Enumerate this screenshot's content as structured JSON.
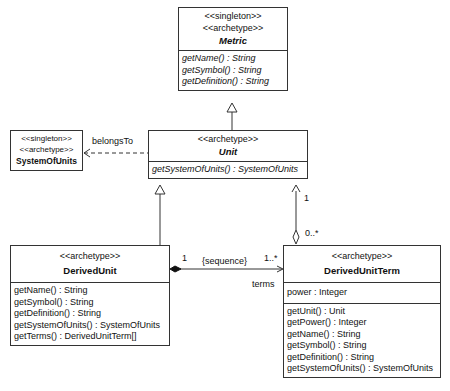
{
  "classes": {
    "metric": {
      "stereotypes": [
        "<<singleton>>",
        "<<archetype>>"
      ],
      "name": "Metric",
      "operations": [
        "getName() : String",
        "getSymbol() : String",
        "getDefinition() : String"
      ]
    },
    "unit": {
      "stereotypes": [
        "<<archetype>>"
      ],
      "name": "Unit",
      "operations": [
        "getSystemOfUnits() : SystemOfUnits"
      ]
    },
    "system_of_units": {
      "stereotypes": [
        "<<singleton>>",
        "<<archetype>>"
      ],
      "name": "SystemOfUnits"
    },
    "derived_unit": {
      "stereotypes": [
        "<<archetype>>"
      ],
      "name": "DerivedUnit",
      "operations": [
        "getName() : String",
        "getSymbol() : String",
        "getDefinition() : String",
        "getSystemOfUnits() : SystemOfUnits",
        "getTerms() : DerivedUnitTerm[]"
      ]
    },
    "derived_unit_term": {
      "stereotypes": [
        "<<archetype>>"
      ],
      "name": "DerivedUnitTerm",
      "attributes": [
        "power : Integer"
      ],
      "operations": [
        "getUnit() : Unit",
        "getPower() : Integer",
        "getName() : String",
        "getSymbol() : String",
        "getDefinition() : String",
        "getSystemOfUnits() : SystemOfUnits"
      ]
    }
  },
  "relations": {
    "belongs_to": {
      "label": "belongsTo"
    },
    "unit_term": {
      "unit_mult": "1",
      "term_mult": "0..*"
    },
    "composition": {
      "source_mult": "1",
      "constraint": "{sequence}",
      "target_mult": "1..*",
      "role": "terms"
    }
  }
}
